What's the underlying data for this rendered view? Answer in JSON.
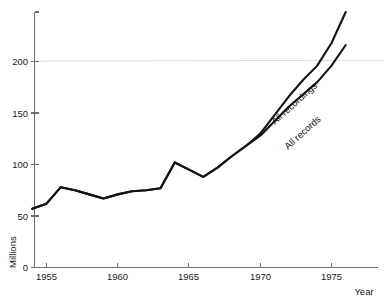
{
  "chart_data": {
    "type": "line",
    "title": "",
    "subtitle": "",
    "xlabel": "Year",
    "ylabel": "Millions",
    "xlim": [
      1954,
      1976.2
    ],
    "ylim": [
      0,
      248
    ],
    "grid": false,
    "legend_position": "inline-rotated-labels",
    "x_ticks": [
      1955,
      1960,
      1965,
      1970,
      1975
    ],
    "x_tick_labels": [
      "1955",
      "1960",
      "1965",
      "1970",
      "1975"
    ],
    "y_ticks": [
      0,
      50,
      100,
      150,
      200
    ],
    "y_tick_labels": [
      "0",
      "50",
      "100",
      "150",
      "200"
    ],
    "annotations": [
      {
        "text": "All recordings",
        "series": "All recordings",
        "rotation_deg": -42
      },
      {
        "text": "All records",
        "series": "All records",
        "rotation_deg": -42
      }
    ],
    "series": [
      {
        "name": "All recordings",
        "color": "#141414",
        "x": [
          1954,
          1955,
          1956,
          1957,
          1958,
          1959,
          1960,
          1961,
          1962,
          1963,
          1964,
          1965,
          1966,
          1967,
          1968,
          1969,
          1970,
          1971,
          1972,
          1973,
          1974,
          1975,
          1976
        ],
        "values": [
          57,
          62,
          78,
          75,
          71,
          67,
          71,
          74,
          75,
          77,
          102,
          95,
          88,
          97,
          108,
          118,
          130,
          148,
          166,
          182,
          196,
          218,
          248
        ]
      },
      {
        "name": "All records",
        "color": "#141414",
        "x": [
          1954,
          1955,
          1956,
          1957,
          1958,
          1959,
          1960,
          1961,
          1962,
          1963,
          1964,
          1965,
          1966,
          1967,
          1968,
          1969,
          1970,
          1971,
          1972,
          1973,
          1974,
          1975,
          1976
        ],
        "values": [
          57,
          62,
          78,
          75,
          71,
          67,
          71,
          74,
          75,
          77,
          102,
          95,
          88,
          97,
          108,
          118,
          128,
          142,
          156,
          168,
          180,
          196,
          216
        ]
      }
    ]
  },
  "axes": {
    "y_axis_title": "Millions",
    "x_axis_title": "Year"
  },
  "labels": {
    "series_upper": "All recordings",
    "series_lower": "All records"
  }
}
